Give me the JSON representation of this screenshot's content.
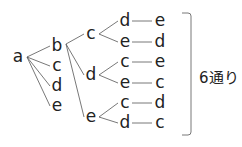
{
  "tree": {
    "root": "a",
    "level1": [
      "b",
      "c",
      "d",
      "e"
    ],
    "level2": [
      "c",
      "d",
      "e"
    ],
    "level3": [
      "d",
      "e",
      "c",
      "e",
      "c",
      "d"
    ],
    "level4": [
      "e",
      "d",
      "e",
      "c",
      "d",
      "c"
    ]
  },
  "result_label": "6通り",
  "colors": {
    "line": "#555555",
    "text": "#222222"
  }
}
